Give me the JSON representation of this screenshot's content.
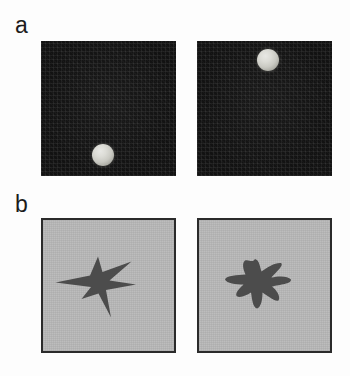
{
  "figure": {
    "width": 350,
    "height": 376,
    "background_color": "#fdfdfd",
    "rows": [
      {
        "label": "a",
        "description": "Two dark panels each containing a small light shaded sphere at different locations"
      },
      {
        "label": "b",
        "description": "Two light gray panels each containing a dark silhouette shape"
      }
    ]
  },
  "panels": {
    "a_left": {
      "name": "dark-panel-sphere-lower-left",
      "background_color": "#121212",
      "x": 41,
      "y": 41,
      "width": 135,
      "height": 135,
      "object": {
        "name": "sphere",
        "color": "#dcdcd6",
        "center_x": 103,
        "center_y": 155,
        "radius": 11,
        "position_label": "lower-left"
      }
    },
    "a_right": {
      "name": "dark-panel-sphere-upper-right",
      "background_color": "#121212",
      "x": 197,
      "y": 41,
      "width": 135,
      "height": 135,
      "object": {
        "name": "sphere",
        "color": "#dcdcd6",
        "center_x": 268,
        "center_y": 60,
        "radius": 11,
        "position_label": "upper-middle"
      }
    },
    "b_left": {
      "name": "gray-panel-spiky-star",
      "background_color": "#b9b9b9",
      "border_color": "#2b2b2b",
      "x": 41,
      "y": 218,
      "width": 135,
      "height": 135,
      "object": {
        "name": "spiky-star-silhouette",
        "color": "#4c4c4c",
        "shape": "irregular five-pointed star with sharp spikes"
      }
    },
    "b_right": {
      "name": "gray-panel-rounded-blob",
      "background_color": "#b9b9b9",
      "border_color": "#2b2b2b",
      "x": 197,
      "y": 218,
      "width": 135,
      "height": 135,
      "object": {
        "name": "rounded-blob-silhouette",
        "color": "#4c4c4c",
        "shape": "smoothed rounded version of the five-pointed star"
      }
    }
  },
  "colors": {
    "page_background": "#fdfdfd",
    "dark_panel": "#121212",
    "gray_panel": "#b9b9b9",
    "panel_border": "#2b2b2b",
    "silhouette": "#4c4c4c",
    "sphere_highlight": "#e8e8e4",
    "label_text": "#1c1c1c"
  }
}
